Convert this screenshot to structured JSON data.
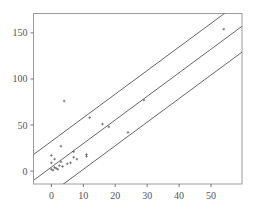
{
  "chart_data": {
    "type": "scatter",
    "title": "",
    "xlabel": "",
    "ylabel": "",
    "xlim": [
      -5.6,
      59.7
    ],
    "ylim": [
      -14,
      171
    ],
    "grid": false,
    "legend": "none",
    "x_ticks": [
      0,
      10,
      20,
      30,
      40,
      50
    ],
    "x_tick_labels": [
      "0",
      "10",
      "20",
      "30",
      "40",
      "50"
    ],
    "y_ticks": [
      0,
      50,
      100,
      150
    ],
    "y_tick_labels": [
      "0",
      "50",
      "100",
      "150"
    ],
    "points": [
      {
        "x": 0,
        "y": 2
      },
      {
        "x": 0,
        "y": 9
      },
      {
        "x": 0,
        "y": 17
      },
      {
        "x": 0.5,
        "y": 1
      },
      {
        "x": 1,
        "y": 4
      },
      {
        "x": 1,
        "y": 13
      },
      {
        "x": 1.5,
        "y": 3
      },
      {
        "x": 2,
        "y": 2
      },
      {
        "x": 2.5,
        "y": 6
      },
      {
        "x": 3,
        "y": 10
      },
      {
        "x": 3,
        "y": 27
      },
      {
        "x": 3.5,
        "y": 5
      },
      {
        "x": 4,
        "y": 76
      },
      {
        "x": 5,
        "y": 8
      },
      {
        "x": 6,
        "y": 9
      },
      {
        "x": 7,
        "y": 15
      },
      {
        "x": 7,
        "y": 21
      },
      {
        "x": 8,
        "y": 13
      },
      {
        "x": 11,
        "y": 16
      },
      {
        "x": 11,
        "y": 18
      },
      {
        "x": 12,
        "y": 58
      },
      {
        "x": 16,
        "y": 51
      },
      {
        "x": 18,
        "y": 48
      },
      {
        "x": 24,
        "y": 42
      },
      {
        "x": 29,
        "y": 77
      },
      {
        "x": 54,
        "y": 154
      }
    ],
    "lines": [
      {
        "name": "upper-prediction-bound",
        "slope": 2.56,
        "intercept": 32.3
      },
      {
        "name": "regression-fit",
        "slope": 2.56,
        "intercept": 4.3
      },
      {
        "name": "lower-prediction-bound",
        "slope": 2.56,
        "intercept": -23.7
      }
    ]
  }
}
